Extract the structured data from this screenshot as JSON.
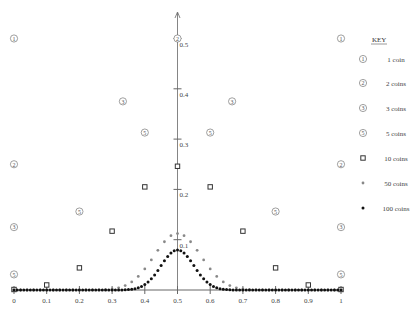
{
  "chart_data": {
    "type": "scatter",
    "title": "",
    "xlabel": "",
    "ylabel": "",
    "xlim": [
      0,
      1
    ],
    "ylim": [
      0,
      0.5
    ],
    "grid": false,
    "legend_position": "right",
    "legend_title": "KEY",
    "x_ticks": [
      "0",
      "0.1",
      "0.2",
      "0.3",
      "0.4",
      "0.5",
      "0.6",
      "0.7",
      "0.8",
      "0.9",
      "1"
    ],
    "y_ticks": [
      "0.1",
      "0.2",
      "0.3",
      "0.4",
      "0.5"
    ],
    "series": [
      {
        "name": "1 coins",
        "n": 1,
        "marker": "circled-1",
        "x": [
          0,
          1
        ],
        "y": [
          0.5,
          0.5
        ]
      },
      {
        "name": "2 coins",
        "n": 2,
        "marker": "circled-2",
        "x": [
          0,
          0.5,
          1
        ],
        "y": [
          0.25,
          0.5,
          0.25
        ]
      },
      {
        "name": "3 coins",
        "n": 3,
        "marker": "circled-3",
        "x": [
          0,
          0.333,
          0.667,
          1
        ],
        "y": [
          0.125,
          0.375,
          0.375,
          0.125
        ]
      },
      {
        "name": "5 coins",
        "n": 5,
        "marker": "circled-5",
        "x": [
          0,
          0.2,
          0.4,
          0.6,
          0.8,
          1
        ],
        "y": [
          0.031,
          0.156,
          0.313,
          0.313,
          0.156,
          0.031
        ]
      },
      {
        "name": "10 coins",
        "n": 10,
        "marker": "square",
        "x": [
          0,
          0.1,
          0.2,
          0.3,
          0.4,
          0.5,
          0.6,
          0.7,
          0.8,
          0.9,
          1
        ],
        "y": [
          0.001,
          0.01,
          0.044,
          0.117,
          0.205,
          0.246,
          0.205,
          0.117,
          0.044,
          0.01,
          0.001
        ]
      },
      {
        "name": "50 coins",
        "n": 50,
        "marker": "gray-dot",
        "x_step": 0.02,
        "peak_y": 0.112
      },
      {
        "name": "100 coins",
        "n": 100,
        "marker": "black-dot",
        "x_step": 0.01,
        "peak_y": 0.08
      }
    ]
  },
  "legend": {
    "title": "KEY",
    "items": [
      {
        "glyph": "1",
        "label": "1 coin"
      },
      {
        "glyph": "2",
        "label": "2 coins"
      },
      {
        "glyph": "3",
        "label": "3 coins"
      },
      {
        "glyph": "5",
        "label": "5 coins"
      },
      {
        "glyph": "square",
        "label": "10 coins"
      },
      {
        "glyph": "gray-dot",
        "label": "50 coins"
      },
      {
        "glyph": "black-dot",
        "label": "100 coins"
      }
    ]
  },
  "colors": {
    "axis": "#666666",
    "marker_outline": "#777777",
    "square": "#333333",
    "dot50": "#888888",
    "dot100": "#111111"
  }
}
